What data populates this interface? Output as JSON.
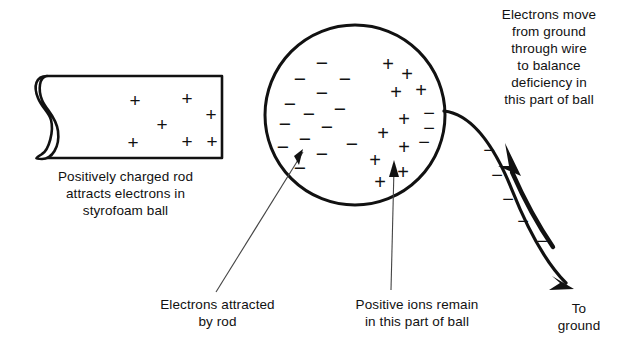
{
  "figure": {
    "title_text": "",
    "background": "#ffffff",
    "ink": "#111111"
  },
  "captions": {
    "rod_caption": "Positively charged rod\nattracts electrons in\nstyrofoam ball",
    "wire_caption": "Electrons move\nfrom ground\nthrough wire\nto balance\ndeficiency in\nthis part of ball",
    "electrons_caption": "Electrons attracted\nby rod",
    "ions_caption": "Positive ions remain\nin this part of ball",
    "ground_caption": "To\nground"
  },
  "labels": {
    "plus_glyph": "+",
    "minus_glyph": "−"
  },
  "rod": {
    "name": "positively-charged-rod",
    "charge_symbol": "+",
    "charge_count": 7,
    "charges": [
      {
        "x": 135,
        "y": 100
      },
      {
        "x": 187,
        "y": 98
      },
      {
        "x": 211,
        "y": 114
      },
      {
        "x": 162,
        "y": 124
      },
      {
        "x": 133,
        "y": 142
      },
      {
        "x": 187,
        "y": 141
      },
      {
        "x": 212,
        "y": 141
      }
    ]
  },
  "ball": {
    "name": "styrofoam-ball",
    "center_x": 355,
    "center_y": 115,
    "radius": 90,
    "negative_charges": [
      {
        "x": 322,
        "y": 62
      },
      {
        "x": 300,
        "y": 78
      },
      {
        "x": 322,
        "y": 92
      },
      {
        "x": 290,
        "y": 103
      },
      {
        "x": 309,
        "y": 113
      },
      {
        "x": 285,
        "y": 123
      },
      {
        "x": 327,
        "y": 126
      },
      {
        "x": 305,
        "y": 138
      },
      {
        "x": 322,
        "y": 153
      },
      {
        "x": 300,
        "y": 167
      },
      {
        "x": 250,
        "y": 0
      },
      {
        "x": 250,
        "y": 0
      }
    ],
    "positive_charges": [
      {
        "x": 388,
        "y": 64
      },
      {
        "x": 407,
        "y": 74
      },
      {
        "x": 396,
        "y": 92
      },
      {
        "x": 421,
        "y": 90
      },
      {
        "x": 404,
        "y": 119
      },
      {
        "x": 383,
        "y": 133
      },
      {
        "x": 404,
        "y": 147
      },
      {
        "x": 375,
        "y": 160
      },
      {
        "x": 403,
        "y": 172
      },
      {
        "x": 380,
        "y": 182
      }
    ],
    "edge_negative_charges": [
      {
        "x": 429,
        "y": 113
      },
      {
        "x": 429,
        "y": 128
      },
      {
        "x": 424,
        "y": 142
      }
    ]
  },
  "wire": {
    "name": "ground-wire",
    "direction": "to-ground",
    "electron_flow_direction": "toward-ball",
    "charge_symbol": "−",
    "charges": [
      {
        "x": 489,
        "y": 150
      },
      {
        "x": 497,
        "y": 175
      },
      {
        "x": 508,
        "y": 199
      },
      {
        "x": 523,
        "y": 221
      },
      {
        "x": 542,
        "y": 241
      }
    ]
  },
  "leader_lines": [
    {
      "name": "electrons-leader",
      "from_x": 216,
      "from_y": 290,
      "to_x": 300,
      "to_y": 148
    },
    {
      "name": "ions-leader",
      "from_x": 390,
      "from_y": 288,
      "to_x": 393,
      "to_y": 163
    }
  ]
}
